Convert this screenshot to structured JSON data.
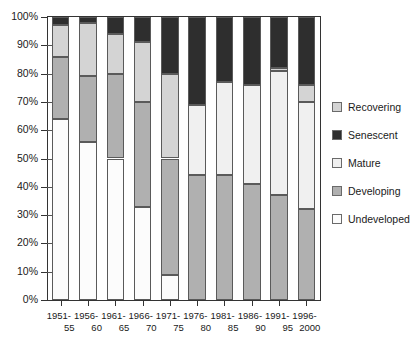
{
  "chart_data": {
    "type": "bar",
    "stacked": true,
    "normalized_percent": true,
    "title": "",
    "subtitle": "",
    "xlabel": "",
    "ylabel": "",
    "ylim": [
      0,
      100
    ],
    "ytick_values": [
      0,
      10,
      20,
      30,
      40,
      50,
      60,
      70,
      80,
      90,
      100
    ],
    "ytick_labels": [
      "0%",
      "10%",
      "20%",
      "30%",
      "40%",
      "50%",
      "60%",
      "70%",
      "80%",
      "90%",
      "100%"
    ],
    "grid": false,
    "legend_position": "right",
    "categories": [
      "1951-55",
      "1956-60",
      "1961-65",
      "1966-70",
      "1971-75",
      "1976-80",
      "1981-85",
      "1986-90",
      "1991-95",
      "1996-2000"
    ],
    "category_labels": [
      {
        "line1": "1951-",
        "line2": "55"
      },
      {
        "line1": "1956-",
        "line2": "60"
      },
      {
        "line1": "1961-",
        "line2": "65"
      },
      {
        "line1": "1966-",
        "line2": "70"
      },
      {
        "line1": "1971-",
        "line2": "75"
      },
      {
        "line1": "1976-",
        "line2": "80"
      },
      {
        "line1": "1981-",
        "line2": "85"
      },
      {
        "line1": "1986-",
        "line2": "90"
      },
      {
        "line1": "1991-",
        "line2": "95"
      },
      {
        "line1": "1996-",
        "line2": "2000"
      }
    ],
    "stack_order_bottom_to_top": [
      "Undeveloped",
      "Developing",
      "Mature",
      "Recovering",
      "Senescent"
    ],
    "series": [
      {
        "name": "Undeveloped",
        "color": "#fcfcfc",
        "values": [
          64,
          56,
          50,
          33,
          9,
          0,
          0,
          0,
          0,
          0
        ]
      },
      {
        "name": "Developing",
        "color": "#b0b0b0",
        "values": [
          22,
          23,
          30,
          37,
          41,
          44,
          44,
          41,
          37,
          32
        ]
      },
      {
        "name": "Mature",
        "color": "#f0f0f0",
        "values": [
          0,
          0,
          0,
          0,
          0,
          25,
          33,
          35,
          44,
          38
        ]
      },
      {
        "name": "Recovering",
        "color": "#d4d4d4",
        "values": [
          11,
          19,
          14,
          21,
          30,
          0,
          0,
          0,
          1,
          6
        ]
      },
      {
        "name": "Senescent",
        "color": "#2e2e2e",
        "values": [
          3,
          2,
          6,
          9,
          20,
          31,
          23,
          24,
          18,
          24
        ]
      }
    ]
  },
  "legend": {
    "entries": [
      {
        "label": "Recovering",
        "color": "#d4d4d4"
      },
      {
        "label": "Senescent",
        "color": "#2e2e2e"
      },
      {
        "label": "Mature",
        "color": "#f0f0f0"
      },
      {
        "label": "Developing",
        "color": "#b0b0b0"
      },
      {
        "label": "Undeveloped",
        "color": "#fcfcfc"
      }
    ]
  }
}
